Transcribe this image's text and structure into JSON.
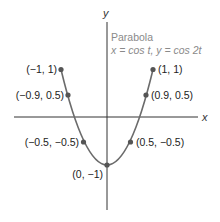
{
  "diagram": {
    "title": "Parabola",
    "equation": "x = cos t, y = cos 2t",
    "x_axis_label": "x",
    "y_axis_label": "y",
    "curve_color": "#6b6b6b",
    "axis_color": "#333333",
    "point_color": "#555555",
    "points": [
      {
        "label": "(−1, 1)",
        "x": -1,
        "y": 1
      },
      {
        "label": "(−0.9, 0.5)",
        "x": -0.9,
        "y": 0.5
      },
      {
        "label": "(1, 1)",
        "x": 1,
        "y": 1
      },
      {
        "label": "(0.9, 0.5)",
        "x": 0.9,
        "y": 0.5
      },
      {
        "label": "(−0.5, −0.5)",
        "x": -0.5,
        "y": -0.5
      },
      {
        "label": "(0.5, −0.5)",
        "x": 0.5,
        "y": -0.5
      },
      {
        "label": "(0, −1)",
        "x": 0,
        "y": -1
      }
    ]
  }
}
